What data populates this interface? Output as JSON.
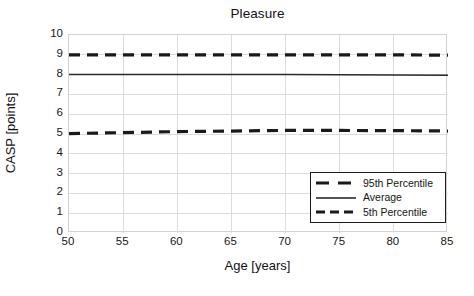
{
  "chart_data": {
    "type": "line",
    "title": "Pleasure",
    "xlabel": "Age [years]",
    "ylabel": "CASP [points]",
    "xlim": [
      50,
      85
    ],
    "ylim": [
      0,
      10
    ],
    "xticks": [
      50,
      55,
      60,
      65,
      70,
      75,
      80,
      85
    ],
    "yticks": [
      0,
      1,
      2,
      3,
      4,
      5,
      6,
      7,
      8,
      9,
      10
    ],
    "grid": true,
    "legend_position": "lower right",
    "x": [
      50,
      55,
      60,
      65,
      70,
      75,
      80,
      85
    ],
    "series": [
      {
        "name": "95th Percentile",
        "style": "dashed",
        "color": "#1a1a1a",
        "values": [
          9.0,
          9.0,
          9.0,
          9.0,
          9.0,
          9.0,
          9.0,
          8.98
        ]
      },
      {
        "name": "Average",
        "style": "solid",
        "color": "#2b2b2b",
        "values": [
          8.0,
          8.0,
          8.0,
          8.0,
          8.0,
          7.99,
          7.98,
          7.97
        ]
      },
      {
        "name": "5th Percentile",
        "style": "dashed",
        "color": "#1a1a1a",
        "values": [
          5.02,
          5.07,
          5.12,
          5.15,
          5.18,
          5.18,
          5.17,
          5.15
        ]
      }
    ]
  },
  "colors": {
    "line": "#1a1a1a",
    "grid": "#dcdcdc",
    "frame": "#d2d2d2",
    "text": "#111111",
    "legend_border": "#1c1c1c",
    "background": "#ffffff"
  },
  "legend": {
    "items": [
      {
        "label": "95th Percentile",
        "swatch": "dashed-thick-line-icon"
      },
      {
        "label": "Average",
        "swatch": "solid-thin-line-icon"
      },
      {
        "label": "5th Percentile",
        "swatch": "dashed-thick-line-icon"
      }
    ]
  },
  "y_tick_labels": [
    "10",
    "9",
    "8",
    "7",
    "6",
    "5",
    "4",
    "3",
    "2",
    "1",
    "0"
  ],
  "x_tick_labels": [
    "50",
    "55",
    "60",
    "65",
    "70",
    "75",
    "80",
    "85"
  ]
}
